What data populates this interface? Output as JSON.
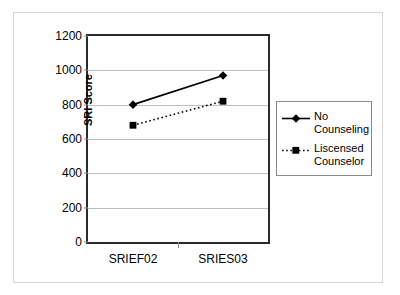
{
  "chart_data": {
    "type": "line",
    "title": "",
    "xlabel": "",
    "ylabel": "SRI Score",
    "categories": [
      "SRIEF02",
      "SRIES03"
    ],
    "ylim": [
      0,
      1200
    ],
    "yticks": [
      0,
      200,
      400,
      600,
      800,
      1000,
      1200
    ],
    "ytick_labels": [
      "0",
      "200",
      "400",
      "600",
      "800",
      "1000",
      "1200"
    ],
    "grid": true,
    "legend_position": "right",
    "series": [
      {
        "name": "No Counseling",
        "values": [
          800,
          970
        ],
        "line_style": "solid",
        "marker": "diamond",
        "color": "#000000"
      },
      {
        "name": "Liscensed Counselor",
        "values": [
          680,
          820
        ],
        "line_style": "dotted",
        "marker": "square",
        "color": "#000000"
      }
    ]
  },
  "legend": {
    "entries": [
      {
        "label": "No Counseling"
      },
      {
        "label": "Liscensed Counselor"
      }
    ]
  },
  "colors": {
    "series": "#000000",
    "gridline": "#bfbfbf",
    "axis": "#2b2b2b",
    "frame": "#d6d6d6"
  }
}
